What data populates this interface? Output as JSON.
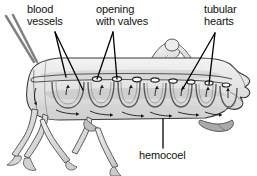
{
  "figure": {
    "background_color": "#ffffff",
    "ink_color": "#111111",
    "body_fill_color": "#e8e8e8",
    "body_shade_color": "#c9c9c9",
    "outline_color": "#3a3a3a"
  },
  "labels": {
    "blood_vessels": {
      "line1": "blood",
      "line2": "vessels",
      "full": "blood vessels"
    },
    "opening_with_valves": {
      "line1": "opening",
      "line2": "with valves",
      "full": "opening with valves"
    },
    "tubular_hearts": {
      "line1": "tubular",
      "line2": "hearts",
      "full": "tubular hearts"
    },
    "hemocoel": {
      "line1": "hemocoel",
      "full": "hemocoel"
    }
  },
  "anatomy": {
    "ostia_count": 8,
    "heart_chamber_count": 7,
    "leg_count": 4,
    "antenna_count": 2,
    "flow_arrow_count": 14
  }
}
